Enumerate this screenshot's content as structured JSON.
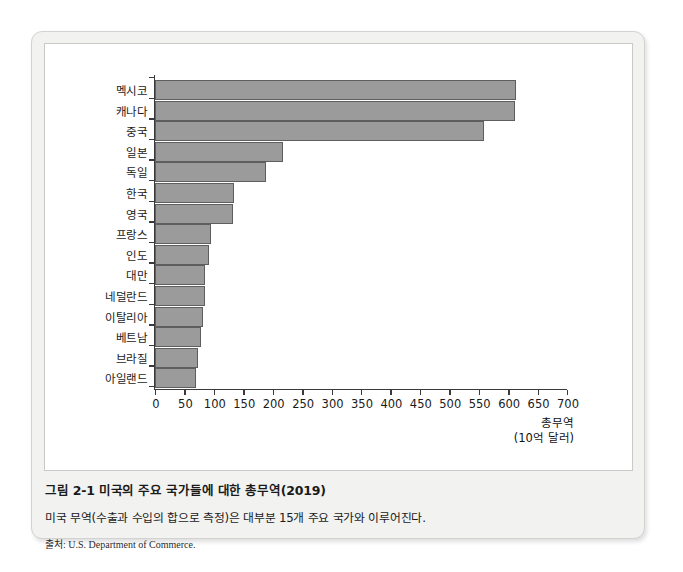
{
  "figure": {
    "caption_title": "그림 2-1 미국의 주요 국가들에 대한 총무역(2019)",
    "caption_desc": "미국 무역(수출과 수입의 합으로 측정)은 대부분 15개 주요 국가와 이루어진다.",
    "caption_source": "출처: U.S. Department of Commerce."
  },
  "colors": {
    "bar_fill": "#9b9b9b",
    "bar_stroke": "#5e5e5e",
    "axis": "#3a3a3a",
    "card_bg": "#f2f2f1",
    "panel_bg": "#ffffff"
  },
  "chart_data": {
    "type": "bar",
    "orientation": "horizontal",
    "title": "",
    "xlabel": "총무역",
    "xlabel_unit": "(10억 달러)",
    "ylabel": "",
    "xlim": [
      0,
      700
    ],
    "xticks": [
      0,
      50,
      100,
      150,
      200,
      250,
      300,
      350,
      400,
      450,
      500,
      550,
      600,
      650,
      700
    ],
    "grid": false,
    "legend": false,
    "categories": [
      "멕시코",
      "캐나다",
      "중국",
      "일본",
      "독일",
      "한국",
      "영국",
      "프랑스",
      "인도",
      "대만",
      "네덜란드",
      "이탈리아",
      "베트남",
      "브라질",
      "아일랜드"
    ],
    "values": [
      614,
      612,
      559,
      218,
      188,
      135,
      133,
      95,
      92,
      85,
      85,
      82,
      78,
      73,
      70
    ]
  }
}
